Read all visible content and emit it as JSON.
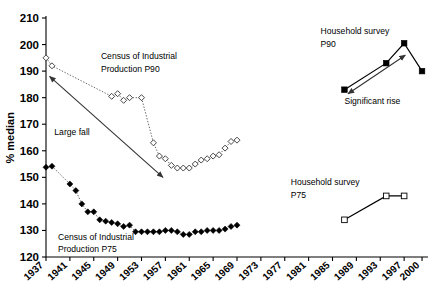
{
  "chart_data": {
    "type": "line",
    "title": "",
    "xlabel": "",
    "ylabel": "% median",
    "xlim": [
      1937,
      2001
    ],
    "ylim": [
      120,
      210
    ],
    "grid": false,
    "legend_position": "inline-annotations",
    "x_ticks": [
      "1937",
      "1941",
      "1945",
      "1949",
      "1953",
      "1957",
      "1961",
      "1965",
      "1969",
      "1973",
      "1977",
      "1981",
      "1985",
      "1989",
      "1993",
      "1997",
      "2000"
    ],
    "y_ticks": [
      "120",
      "130",
      "140",
      "150",
      "160",
      "170",
      "180",
      "190",
      "200",
      "210"
    ],
    "series": [
      {
        "name": "Census of Industrial Production P90",
        "marker": "open-diamond",
        "line": "dotted",
        "x": [
          1937,
          1938,
          1948,
          1949,
          1950,
          1951,
          1953,
          1955,
          1956,
          1957,
          1958,
          1959,
          1960,
          1961,
          1962,
          1963,
          1964,
          1965,
          1966,
          1967,
          1968,
          1969
        ],
        "values": [
          195,
          192,
          180.5,
          181.5,
          179,
          180,
          180,
          163,
          158,
          157,
          154.5,
          153.5,
          153.5,
          153.5,
          155,
          156.5,
          157,
          158,
          158.5,
          161,
          163.5,
          164
        ]
      },
      {
        "name": "Census of Industrial Production P75",
        "marker": "filled-diamond",
        "line": "dotted",
        "x": [
          1937,
          1938,
          1941,
          1942,
          1943,
          1944,
          1945,
          1946,
          1947,
          1948,
          1949,
          1950,
          1951,
          1952,
          1953,
          1954,
          1955,
          1956,
          1957,
          1958,
          1959,
          1960,
          1961,
          1962,
          1963,
          1964,
          1965,
          1966,
          1967,
          1968,
          1969
        ],
        "values": [
          153.8,
          154.2,
          147.5,
          145,
          140,
          137,
          137,
          134,
          133.5,
          133,
          132.5,
          131.5,
          132,
          129.5,
          129.5,
          129.5,
          129.5,
          129.5,
          130,
          130,
          129.5,
          128.5,
          128.5,
          129.5,
          129.5,
          130,
          130,
          130,
          130.5,
          131.5,
          132
        ]
      },
      {
        "name": "Household survey P90",
        "marker": "filled-square",
        "line": "solid",
        "x": [
          1987,
          1994,
          1997,
          2000
        ],
        "values": [
          183,
          193,
          200.5,
          190
        ]
      },
      {
        "name": "Household survey P75",
        "marker": "open-square",
        "line": "solid",
        "x": [
          1987,
          1994,
          1997
        ],
        "values": [
          134,
          143,
          143
        ]
      }
    ],
    "annotations": [
      {
        "id": "census-p90-label",
        "text": "Census of Industrial",
        "x": 1946.2,
        "y": 194.5
      },
      {
        "id": "census-p90-label2",
        "text": "Production P90",
        "x": 1946.2,
        "y": 189.5
      },
      {
        "id": "census-p75-label",
        "text": "Census of Industrial",
        "x": 1939.0,
        "y": 126.5
      },
      {
        "id": "census-p75-label2",
        "text": "Production P75",
        "x": 1939.0,
        "y": 122.0
      },
      {
        "id": "large-fall-label",
        "text": "Large fall",
        "x": 1938.4,
        "y": 166.0
      },
      {
        "id": "household-p90-label",
        "text": "Household survey",
        "x": 1983.0,
        "y": 204.0
      },
      {
        "id": "household-p90-label2",
        "text": "P90",
        "x": 1983.0,
        "y": 199.2
      },
      {
        "id": "significant-rise-label",
        "text": "Significant rise",
        "x": 1987.0,
        "y": 177.5
      },
      {
        "id": "household-p75-label",
        "text": "Household survey",
        "x": 1978.0,
        "y": 147.0
      },
      {
        "id": "household-p75-label2",
        "text": "P75",
        "x": 1978.0,
        "y": 142.2
      }
    ],
    "arrows": [
      {
        "id": "large-fall-arrow",
        "x1": 1937.6,
        "y1": 188.0,
        "x2": 1956.6,
        "y2": 150.0,
        "double": true
      },
      {
        "id": "significant-rise-arrow",
        "x1": 1987.6,
        "y1": 181.5,
        "x2": 1997.2,
        "y2": 196.0,
        "double": true
      }
    ],
    "colors": {
      "ink": "#000000",
      "dotted": "#555555",
      "background": "#ffffff"
    }
  }
}
